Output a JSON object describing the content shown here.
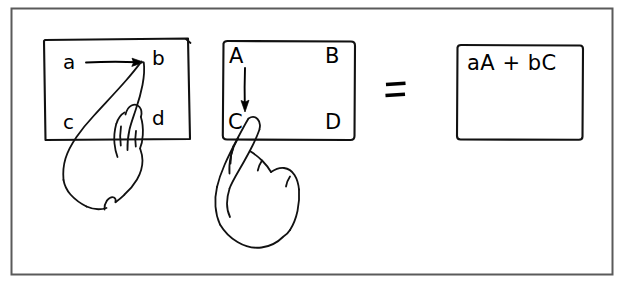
{
  "figure": {
    "kind": "hand-drawn-diagram",
    "title_text": "",
    "background_color": "#ffffff",
    "ink_color": "#000000",
    "border": {
      "name": "outer-frame",
      "x": 11,
      "y": 8,
      "width": 602,
      "height": 267
    }
  },
  "panels": [
    {
      "id": "left-matrix",
      "label": "row-vector-source-matrix",
      "box": {
        "x": 44,
        "y": 38,
        "width": 146,
        "height": 102
      },
      "cells": [
        {
          "key": "top_left",
          "text": "a",
          "x": 68,
          "y": 68
        },
        {
          "key": "top_right",
          "text": "b",
          "x": 156,
          "y": 68
        },
        {
          "key": "bottom_left",
          "text": "c",
          "x": 68,
          "y": 128
        },
        {
          "key": "bottom_right",
          "text": "d",
          "x": 156,
          "y": 128
        }
      ],
      "gesture": {
        "name": "swipe-right-arrow",
        "direction": "right",
        "from": {
          "x": 86,
          "y": 62
        },
        "to": {
          "x": 143,
          "y": 62
        }
      },
      "hand": {
        "name": "pointing-hand",
        "pointing_at": "b"
      }
    },
    {
      "id": "middle-matrix",
      "label": "column-vector-source-matrix",
      "box": {
        "x": 222,
        "y": 41,
        "width": 133,
        "height": 99
      },
      "cells": [
        {
          "key": "top_left",
          "text": "A",
          "x": 232,
          "y": 62
        },
        {
          "key": "top_right",
          "text": "B",
          "x": 327,
          "y": 62
        },
        {
          "key": "bottom_left",
          "text": "C",
          "x": 232,
          "y": 129
        },
        {
          "key": "bottom_right",
          "text": "D",
          "x": 327,
          "y": 129
        }
      ],
      "gesture": {
        "name": "swipe-down-arrow",
        "direction": "down",
        "from": {
          "x": 245,
          "y": 68
        },
        "to": {
          "x": 245,
          "y": 112
        }
      },
      "hand": {
        "name": "pointing-hand",
        "pointing_at": "C"
      }
    },
    {
      "id": "result-box",
      "label": "result-expression-box",
      "box": {
        "x": 456,
        "y": 45,
        "width": 127,
        "height": 95
      },
      "cells": [
        {
          "key": "expression",
          "text": "aA + bC",
          "x": 468,
          "y": 74
        }
      ],
      "gesture": null,
      "hand": null
    }
  ],
  "operators": [
    {
      "name": "equals-sign",
      "text": "=",
      "x": 386,
      "y": 82,
      "width": 20,
      "height": 18
    }
  ],
  "annotations": {
    "equation_result": "aA + bC",
    "lowercase_letters": [
      "a",
      "b",
      "c",
      "d"
    ],
    "uppercase_letters": [
      "A",
      "B",
      "C",
      "D"
    ]
  }
}
